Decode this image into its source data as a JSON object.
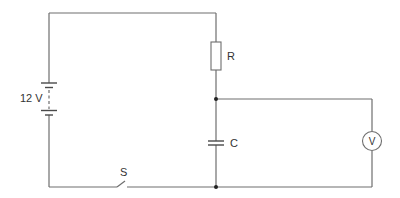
{
  "diagram": {
    "components": {
      "battery": {
        "label": "12 V",
        "type": "battery (multi-cell)"
      },
      "resistor": {
        "label": "R",
        "type": "resistor"
      },
      "capacitor": {
        "label": "C",
        "type": "capacitor"
      },
      "switch": {
        "label": "S",
        "type": "switch (open)"
      },
      "voltmeter": {
        "label": "V",
        "type": "voltmeter"
      }
    },
    "colors": {
      "wire": "#6e6e6e",
      "junction": "#222222",
      "text": "#333333",
      "background": "#ffffff"
    }
  }
}
